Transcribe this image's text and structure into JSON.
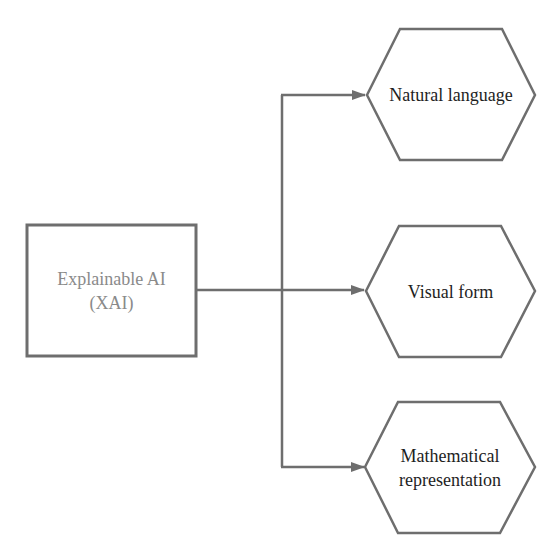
{
  "diagram": {
    "colors": {
      "stroke": "#6e6e6e",
      "text": "#1e1e1e",
      "source_text": "#8a8a8a",
      "background": "#ffffff"
    },
    "source": {
      "line1": "Explainable AI",
      "line2": "(XAI)"
    },
    "targets": [
      {
        "line1": "Natural language",
        "line2": ""
      },
      {
        "line1": "Visual form",
        "line2": ""
      },
      {
        "line1": "Mathematical",
        "line2": "representation"
      }
    ],
    "edges": [
      {
        "from": "Explainable AI (XAI)",
        "to": "Natural language"
      },
      {
        "from": "Explainable AI (XAI)",
        "to": "Visual form"
      },
      {
        "from": "Explainable AI (XAI)",
        "to": "Mathematical representation"
      }
    ]
  }
}
